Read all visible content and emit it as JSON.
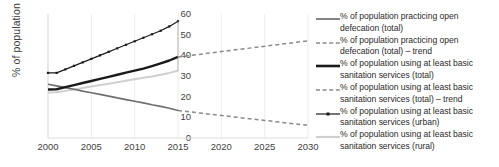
{
  "chart_data": {
    "type": "line",
    "title": "",
    "xlabel": "",
    "ylabel": "% of population",
    "xlim": [
      2000,
      2030
    ],
    "ylim": [
      0,
      60
    ],
    "xticks": [
      "2000",
      "2005",
      "2010",
      "2015",
      "2020",
      "2025",
      "2030"
    ],
    "yticks": [
      "0",
      "10",
      "20",
      "30",
      "40",
      "50",
      "60"
    ],
    "grid": "vertical-light",
    "legend_position": "right",
    "series": [
      {
        "name": "% of population practicing open defecation (total)",
        "style": "solid",
        "color": "#6f6f6f",
        "width": 1.7,
        "marker": "none",
        "x": [
          2000,
          2001,
          2002,
          2003,
          2004,
          2005,
          2006,
          2007,
          2008,
          2009,
          2010,
          2011,
          2012,
          2013,
          2014,
          2015
        ],
        "values": [
          26.0,
          25.2,
          24.4,
          23.6,
          22.7,
          21.9,
          21.1,
          20.3,
          19.4,
          18.6,
          17.8,
          17.0,
          16.1,
          15.3,
          14.4,
          13.3
        ]
      },
      {
        "name": "% of population practicing open defecation (total) – trend",
        "style": "dashed",
        "color": "#8a8a8a",
        "width": 1.5,
        "marker": "none",
        "x": [
          2015,
          2020,
          2025,
          2030
        ],
        "values": [
          13.3,
          10.9,
          8.5,
          6.1
        ]
      },
      {
        "name": "% of population using at least basic sanitation services (total)",
        "style": "solid",
        "color": "#1a1a1a",
        "width": 2.4,
        "marker": "none",
        "x": [
          2000,
          2001,
          2002,
          2003,
          2004,
          2005,
          2006,
          2007,
          2008,
          2009,
          2010,
          2011,
          2012,
          2013,
          2014,
          2015
        ],
        "values": [
          23.5,
          23.6,
          24.6,
          25.6,
          26.6,
          27.6,
          28.6,
          29.6,
          30.6,
          31.6,
          32.6,
          33.6,
          34.8,
          36.1,
          37.5,
          39.2
        ]
      },
      {
        "name": "% of population using at least basic sanitation services (total) – trend",
        "style": "dashed",
        "color": "#8a8a8a",
        "width": 1.5,
        "marker": "none",
        "x": [
          2015,
          2020,
          2025,
          2030
        ],
        "values": [
          39.2,
          41.8,
          44.4,
          47.0
        ]
      },
      {
        "name": "% of population using at least basic sanitation services (urban)",
        "style": "solid",
        "color": "#1a1a1a",
        "width": 1.2,
        "marker": "square",
        "x": [
          2000,
          2001,
          2002,
          2003,
          2004,
          2005,
          2006,
          2007,
          2008,
          2009,
          2010,
          2011,
          2012,
          2013,
          2014,
          2015
        ],
        "values": [
          31.5,
          31.5,
          33.2,
          34.9,
          36.6,
          38.3,
          40.0,
          41.7,
          43.4,
          45.1,
          46.8,
          48.5,
          50.2,
          51.9,
          54.0,
          56.5
        ]
      },
      {
        "name": "% of population using at least basic sanitation services (rural)",
        "style": "solid",
        "color": "#cfcfcf",
        "width": 2.0,
        "marker": "none",
        "x": [
          2000,
          2001,
          2002,
          2003,
          2004,
          2005,
          2006,
          2007,
          2008,
          2009,
          2010,
          2011,
          2012,
          2013,
          2014,
          2015
        ],
        "values": [
          22.0,
          22.1,
          22.8,
          23.5,
          24.2,
          24.9,
          25.6,
          26.3,
          27.0,
          27.7,
          28.4,
          29.1,
          29.8,
          30.6,
          31.5,
          32.5
        ]
      }
    ]
  },
  "axes": {
    "y_title": "% of population",
    "y_ticks": [
      "60",
      "50",
      "40",
      "30",
      "20",
      "10",
      "0"
    ],
    "x_ticks": [
      "2000",
      "2005",
      "2010",
      "2015",
      "2020",
      "2025",
      "2030"
    ]
  },
  "legend": {
    "items": [
      {
        "label": "% of population practicing open defecation (total)",
        "style": "solid",
        "color": "#6f6f6f",
        "width": 1.7,
        "marker": "none"
      },
      {
        "label": "% of population practicing open defecation (total) – trend",
        "style": "dashed",
        "color": "#8a8a8a",
        "width": 1.5,
        "marker": "none"
      },
      {
        "label": "% of population using at least basic sanitation services (total)",
        "style": "solid",
        "color": "#1a1a1a",
        "width": 2.6,
        "marker": "none"
      },
      {
        "label": "% of population using at least basic sanitation services (total) – trend",
        "style": "dashed",
        "color": "#8a8a8a",
        "width": 1.5,
        "marker": "none"
      },
      {
        "label": "% of population using at least basic sanitation services (urban)",
        "style": "solid",
        "color": "#1a1a1a",
        "width": 1.2,
        "marker": "square"
      },
      {
        "label": "% of population using at least basic sanitation services (rural)",
        "style": "solid",
        "color": "#cfcfcf",
        "width": 2.2,
        "marker": "none"
      }
    ]
  }
}
